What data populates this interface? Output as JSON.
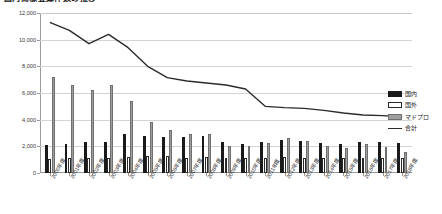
{
  "title": "国内商標登録件数の推移",
  "legend": {
    "position": "right",
    "items": [
      {
        "name": "kokunai",
        "label": "国内",
        "color": "#1a1a1a",
        "marker": "bar"
      },
      {
        "name": "kokugai",
        "label": "国外",
        "color": "#ffffff",
        "marker": "bar"
      },
      {
        "name": "madopro",
        "label": "マドプロ",
        "color": "#9e9e9e",
        "marker": "bar"
      },
      {
        "name": "total",
        "label": "合計",
        "color": "#2b2b2b",
        "marker": "line"
      }
    ]
  },
  "axes": {
    "y_ticks": [
      "0",
      "2,000",
      "4,000",
      "6,000",
      "8,000",
      "10,000",
      "12,000"
    ],
    "y_min": 0,
    "y_max": 12000,
    "y_step": 2000,
    "grid": true
  },
  "chart_data": {
    "type": "bar",
    "title": "国内商標登録件数の推移",
    "xlabel": "",
    "ylabel": "",
    "ylim": [
      0,
      12000
    ],
    "ystep": 2000,
    "grid": true,
    "legend_position": "right",
    "categories": [
      "2000年度",
      "2001年度",
      "2002年度",
      "2003年度",
      "2004年度",
      "2005年度",
      "2006年度",
      "2007年度",
      "2008年度",
      "2009年度",
      "2010年度",
      "2011年度",
      "2012年度",
      "2013年度",
      "2014年度",
      "2015年度",
      "2016年度",
      "2017年度",
      "2018年度"
    ],
    "series": [
      {
        "name": "国内",
        "type": "bar",
        "color": "#1a1a1a",
        "values": [
          2100,
          2150,
          2350,
          2350,
          2900,
          2800,
          2700,
          2700,
          2750,
          2350,
          2200,
          2300,
          2500,
          2400,
          2250,
          2200,
          2350,
          2300,
          2250
        ]
      },
      {
        "name": "国外",
        "type": "bar",
        "color": "#ffffff",
        "values": [
          1050,
          1100,
          1150,
          1100,
          1200,
          1250,
          1250,
          1150,
          1200,
          1100,
          1100,
          1150,
          1200,
          1150,
          1100,
          1100,
          1150,
          1150,
          1100
        ]
      },
      {
        "name": "マドプロ",
        "type": "bar",
        "color": "#9e9e9e",
        "values": [
          7200,
          6600,
          6200,
          6600,
          5400,
          3800,
          3200,
          2900,
          2900,
          2000,
          2050,
          2250,
          2600,
          2400,
          2050,
          1900,
          2150,
          1950,
          1600
        ]
      },
      {
        "name": "合計",
        "type": "line",
        "color": "#2b2b2b",
        "values": [
          11300,
          10700,
          9700,
          10400,
          9400,
          8000,
          7150,
          6900,
          6750,
          6600,
          6300,
          5000,
          4900,
          4850,
          4700,
          4500,
          4350,
          4300,
          4200
        ]
      }
    ]
  }
}
